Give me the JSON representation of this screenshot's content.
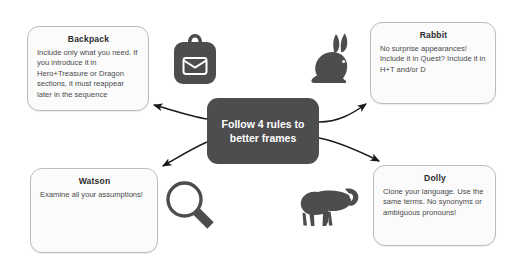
{
  "diagram": {
    "center": {
      "text": "Follow 4 rules to better frames",
      "bg_color": "#4d4d4f",
      "text_color": "#ffffff"
    },
    "nodes": [
      {
        "id": "backpack",
        "title": "Backpack",
        "body": "Include only what you need. If you introduce it in Hero+Treasure or Dragon sections, it must reappear later in the sequence",
        "icon": "backpack-icon"
      },
      {
        "id": "rabbit",
        "title": "Rabbit",
        "body": "No surprise appearances! Include it in Quest? Include it in H+T and/or D",
        "icon": "rabbit-icon"
      },
      {
        "id": "watson",
        "title": "Watson",
        "body": "Examine all your assumptions!",
        "icon": "magnifier-icon"
      },
      {
        "id": "dolly",
        "title": "Dolly",
        "body": "Clone your language. Use the same terms. No synonyms or ambiguous pronouns!",
        "icon": "sheep-icon"
      }
    ],
    "colors": {
      "node_fill": "#fbfbfc",
      "node_border": "#b9bcc0",
      "icon": "#4d4d4f",
      "arrow": "#1a1a1a",
      "background": "#ffffff"
    },
    "arrows": [
      {
        "from": "center",
        "to": "backpack"
      },
      {
        "from": "center",
        "to": "rabbit"
      },
      {
        "from": "center",
        "to": "watson"
      },
      {
        "from": "center",
        "to": "dolly"
      }
    ]
  }
}
